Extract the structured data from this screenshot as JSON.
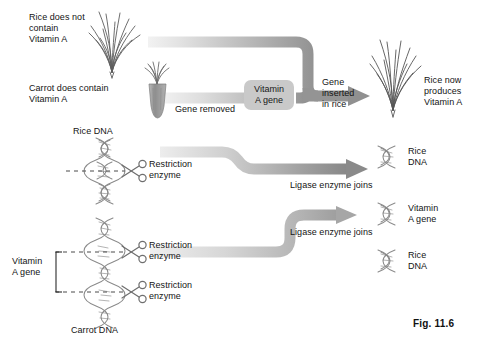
{
  "figure": {
    "caption": "Fig. 11.6",
    "background": "#ffffff"
  },
  "colors": {
    "band_light": "#e8e8e8",
    "band_dark": "#8c8c8c",
    "plant_stroke": "#5a5a5a",
    "carrot_fill": "#9a9a9a",
    "box_fill": "#c9c9c9",
    "dna_stroke": "#8a8a8a",
    "text": "#141414"
  },
  "top_panel": {
    "rice_label": "Rice does not\ncontain\nVitamin A",
    "carrot_label": "Carrot does contain\nVitamin A",
    "gene_removed_label": "Gene removed",
    "vitamin_gene_box": "Vitamin\nA gene",
    "gene_inserted_label": "Gene\ninserted\nin rice",
    "result_label": "Rice now\nproduces\nVitamin A",
    "icons": {
      "rice_plant_left": "rice-plant-icon",
      "carrot": "carrot-icon",
      "rice_plant_right": "rice-plant-icon"
    }
  },
  "bottom_panel": {
    "rice_dna_label": "Rice DNA",
    "carrot_dna_label": "Carrot DNA",
    "vitamin_gene_bracket": "Vitamin\nA gene",
    "restriction_enzyme_1": "Restriction\nenzyme",
    "restriction_enzyme_2": "Restriction\nenzyme",
    "restriction_enzyme_3": "Restriction\nenzyme",
    "ligase_1": "Ligase enzyme joins",
    "ligase_2": "Ligase enzyme joins",
    "product_1": "Rice\nDNA",
    "product_2": "Vitamin\nA gene",
    "product_3": "Rice\nDNA",
    "icons": {
      "scissors": "scissors-icon",
      "dna_helix": "dna-helix-icon"
    }
  }
}
